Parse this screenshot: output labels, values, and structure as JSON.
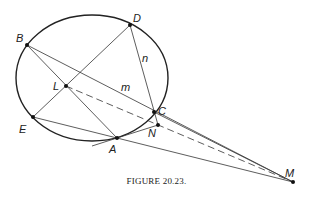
{
  "caption": "FIGURE 20.23.",
  "points": {
    "B": {
      "label": "B",
      "x": 27,
      "y": 45
    },
    "D": {
      "label": "D",
      "x": 130,
      "y": 25
    },
    "L": {
      "label": "L",
      "x": 66,
      "y": 86
    },
    "C": {
      "label": "C",
      "x": 154,
      "y": 112
    },
    "N": {
      "label": "N",
      "x": 158,
      "y": 125
    },
    "E": {
      "label": "E",
      "x": 33,
      "y": 117
    },
    "A": {
      "label": "A",
      "x": 117,
      "y": 138
    },
    "M": {
      "label": "M",
      "x": 293,
      "y": 182
    }
  },
  "line_labels": {
    "m": "m",
    "n": "n"
  },
  "ellipse": {
    "cx": 92,
    "cy": 78,
    "rx": 76,
    "ry": 63
  }
}
